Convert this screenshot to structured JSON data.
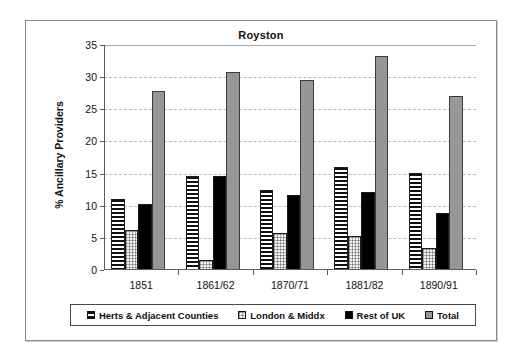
{
  "chart_data": {
    "type": "bar",
    "title": "Royston",
    "xlabel": "",
    "ylabel": "% Ancillary Providers",
    "ylim": [
      0,
      35
    ],
    "ytick_values": [
      0,
      5,
      10,
      15,
      20,
      25,
      30,
      35
    ],
    "ytick_labels": [
      "0",
      "5",
      "10",
      "15",
      "20",
      "25",
      "30",
      "35"
    ],
    "grid": "horizontal-dashed",
    "legend_position": "bottom",
    "categories": [
      "1851",
      "1861/62",
      "1870/71",
      "1881/82",
      "1890/91"
    ],
    "series": [
      {
        "name": "Herts & Adjacent Counties",
        "pattern": "horizontal-stripes",
        "color": "#111111",
        "values": [
          11.1,
          14.7,
          12.4,
          16.1,
          15.1
        ]
      },
      {
        "name": "London & Middx",
        "pattern": "light-checker-dots",
        "color": "#f2f2f2",
        "values": [
          6.2,
          1.6,
          5.8,
          5.3,
          3.4
        ]
      },
      {
        "name": "Rest of UK",
        "pattern": "solid",
        "color": "#000000",
        "values": [
          10.3,
          14.7,
          11.7,
          12.2,
          8.8
        ]
      },
      {
        "name": "Total",
        "pattern": "solid",
        "color": "#969696",
        "values": [
          27.8,
          30.8,
          29.6,
          33.3,
          27.1
        ]
      }
    ]
  },
  "legend": {
    "items": [
      {
        "label": "Herts & Adjacent Counties"
      },
      {
        "label": "London & Middx"
      },
      {
        "label": "Rest of UK"
      },
      {
        "label": "Total"
      }
    ]
  }
}
